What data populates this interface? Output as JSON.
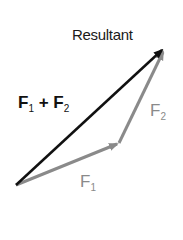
{
  "diagram": {
    "title_label": "Resultant",
    "sum_label": {
      "a": "F",
      "a_sub": "1",
      "op": " + ",
      "b": "F",
      "b_sub": "2"
    },
    "f1_label": {
      "base": "F",
      "sub": "1"
    },
    "f2_label": {
      "base": "F",
      "sub": "2"
    },
    "colors": {
      "resultant": "#111111",
      "component": "#8a8a8a"
    },
    "points": {
      "origin": [
        16,
        185
      ],
      "f1_end": [
        119,
        143
      ],
      "tip": [
        164,
        48
      ]
    }
  }
}
